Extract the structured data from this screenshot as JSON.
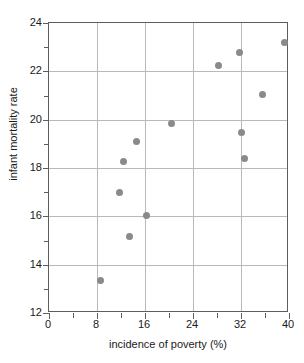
{
  "chart_data": {
    "type": "scatter",
    "title": "",
    "xlabel": "incidence of poverty (%)",
    "ylabel": "infant mortality rate",
    "xlim": [
      0,
      40
    ],
    "ylim": [
      12,
      24
    ],
    "grid": true,
    "legend": null,
    "x_major_ticks": [
      0,
      8,
      16,
      24,
      32,
      40
    ],
    "x_minor_ticks": [
      4,
      12,
      20,
      28,
      36
    ],
    "y_major_ticks": [
      12,
      14,
      16,
      18,
      20,
      22,
      24
    ],
    "y_minor_ticks": [
      13,
      15,
      17,
      19,
      21,
      23
    ],
    "x_gridlines": [
      8,
      16,
      24,
      32
    ],
    "y_gridlines": [
      14,
      16,
      18,
      20,
      22
    ],
    "marker_color": "#8a8a8a",
    "axis_color": "#5e5e5e",
    "grid_color": "#b9b9b9",
    "points": [
      {
        "x": 8.5,
        "y": 13.35
      },
      {
        "x": 11.7,
        "y": 17.0
      },
      {
        "x": 12.4,
        "y": 18.25
      },
      {
        "x": 13.4,
        "y": 15.15
      },
      {
        "x": 14.6,
        "y": 19.1
      },
      {
        "x": 16.2,
        "y": 16.05
      },
      {
        "x": 20.4,
        "y": 19.85
      },
      {
        "x": 28.3,
        "y": 22.25
      },
      {
        "x": 31.8,
        "y": 22.8
      },
      {
        "x": 32.0,
        "y": 19.45
      },
      {
        "x": 32.5,
        "y": 18.4
      },
      {
        "x": 35.6,
        "y": 21.05
      },
      {
        "x": 39.2,
        "y": 23.2
      }
    ]
  }
}
